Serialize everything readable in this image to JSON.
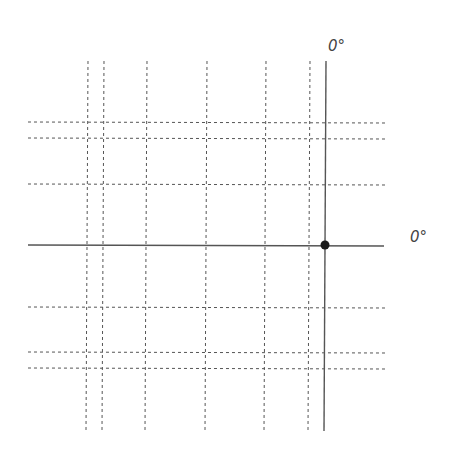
{
  "diagram": {
    "type": "coordinate-grid",
    "labels": {
      "vertical_axis": "0°",
      "horizontal_axis": "0°"
    },
    "vertical_gridlines_x": [
      88,
      104,
      147,
      207,
      266,
      310
    ],
    "horizontal_gridlines_y": [
      122,
      138,
      184,
      307,
      352,
      368
    ],
    "vertical_axis": {
      "x": 326,
      "y1": 61,
      "y2": 431
    },
    "horizontal_axis": {
      "y": 245,
      "x1": 28,
      "x2": 384
    },
    "origin_point": {
      "x": 325,
      "y": 245,
      "r": 4.5
    },
    "colors": {
      "line": "#555555",
      "dash": "#555555",
      "point": "#1a1a1a"
    }
  }
}
